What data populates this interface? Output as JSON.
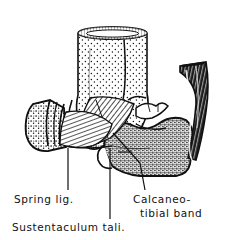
{
  "figure": {
    "style": "black-and-white engraved line drawing with stipple and hatch shading",
    "background_color": "#ffffff",
    "ink_color": "#101010"
  },
  "labels": [
    {
      "id": "spring-ligament",
      "text": "Spring lig.",
      "line1": "Spring lig.",
      "line2": "",
      "x": 14,
      "y": 203,
      "leader": {
        "type": "vertical",
        "x1": 68,
        "y1": 148,
        "x2": 68,
        "y2": 190
      }
    },
    {
      "id": "sustentaculum-tali",
      "text": "Sustentaculum tali.",
      "line1": "Sustentaculum tali.",
      "line2": "",
      "x": 12,
      "y": 231,
      "leader": {
        "type": "vertical",
        "x1": 110,
        "y1": 148,
        "x2": 110,
        "y2": 219
      }
    },
    {
      "id": "calcaneo-tibial-band",
      "text": "Calcaneo-tibial band",
      "line1": "Calcaneo-",
      "line2": "tibial band",
      "x": 133,
      "y": 203,
      "leader": {
        "type": "diagonal",
        "x1": 113,
        "y1": 133,
        "x2": 145,
        "y2": 190
      }
    }
  ],
  "structures": [
    {
      "id": "tibia",
      "name": "tibia-shaft",
      "shading": "stipple"
    },
    {
      "id": "medial-malleolus",
      "name": "medial-malleolus",
      "shading": "stipple"
    },
    {
      "id": "navicular",
      "name": "navicular-bone",
      "shading": "stipple"
    },
    {
      "id": "talus",
      "name": "talus",
      "shading": "outline"
    },
    {
      "id": "calcaneus",
      "name": "calcaneus",
      "shading": "dense-stipple"
    },
    {
      "id": "deltoid-ligament",
      "name": "deltoid-ligament-fibers",
      "shading": "hatch"
    },
    {
      "id": "spring-ligament-fibers",
      "name": "spring-ligament-fibers",
      "shading": "hatch"
    },
    {
      "id": "achilles-tendon",
      "name": "achilles-tendon",
      "shading": "dark-striated"
    }
  ]
}
